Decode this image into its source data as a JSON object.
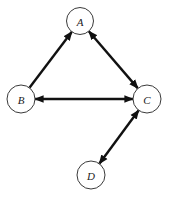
{
  "diagram": {
    "type": "directed-graph",
    "width": 170,
    "height": 199,
    "colors": {
      "background": "#ffffff",
      "node_stroke": "#3a3a3a",
      "edge": "#111111",
      "label": "#222222"
    },
    "nodes": [
      {
        "id": "A",
        "label": "A",
        "cx": 80,
        "cy": 21,
        "r": 13.5
      },
      {
        "id": "B",
        "label": "B",
        "cx": 21,
        "cy": 99,
        "r": 14
      },
      {
        "id": "C",
        "label": "C",
        "cx": 147,
        "cy": 99,
        "r": 14
      },
      {
        "id": "D",
        "label": "D",
        "cx": 91,
        "cy": 175,
        "r": 14
      }
    ],
    "edges": [
      {
        "from": "B",
        "to": "A",
        "arrow_start": false,
        "arrow_end": true
      },
      {
        "from": "A",
        "to": "C",
        "arrow_start": true,
        "arrow_end": true
      },
      {
        "from": "B",
        "to": "C",
        "arrow_start": true,
        "arrow_end": true
      },
      {
        "from": "C",
        "to": "D",
        "arrow_start": true,
        "arrow_end": true
      }
    ]
  }
}
